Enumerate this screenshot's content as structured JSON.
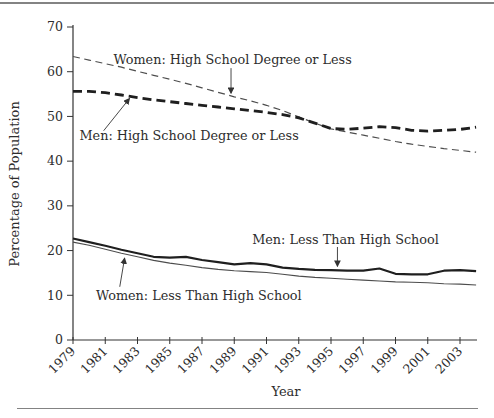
{
  "chart_data": {
    "type": "line",
    "title": "",
    "xlabel": "Year",
    "ylabel": "Percentage of Population",
    "ylim": [
      0,
      70
    ],
    "yticks": [
      0,
      10,
      20,
      30,
      40,
      50,
      60,
      70
    ],
    "xtick_years": [
      1979,
      1981,
      1983,
      1985,
      1987,
      1989,
      1991,
      1993,
      1995,
      1997,
      1999,
      2001,
      2003
    ],
    "x_start": 1979,
    "x_end": 2004,
    "grid": false,
    "legend_position": "inline-annotations",
    "years": [
      1979,
      1980,
      1981,
      1982,
      1983,
      1984,
      1985,
      1986,
      1987,
      1988,
      1989,
      1990,
      1991,
      1992,
      1993,
      1994,
      1995,
      1996,
      1997,
      1998,
      1999,
      2000,
      2001,
      2002,
      2003,
      2004
    ],
    "series": [
      {
        "name": "Women: High School Degree or Less",
        "line_style": "dashed-thin",
        "color": "#4d4d4d",
        "values": [
          63.4,
          62.6,
          61.8,
          61.0,
          60.1,
          59.2,
          58.3,
          57.4,
          56.4,
          55.4,
          54.4,
          53.5,
          52.5,
          51.3,
          49.9,
          48.5,
          47.2,
          46.5,
          45.8,
          45.1,
          44.4,
          43.8,
          43.3,
          42.8,
          42.4,
          42.0
        ]
      },
      {
        "name": "Men: High School Degree or Less",
        "line_style": "dashed-thick",
        "color": "#1f1f1f",
        "values": [
          55.6,
          55.6,
          55.3,
          54.8,
          54.2,
          53.7,
          53.3,
          52.9,
          52.5,
          52.1,
          51.7,
          51.3,
          50.9,
          50.4,
          49.7,
          48.5,
          47.3,
          47.1,
          47.4,
          47.7,
          47.5,
          46.9,
          46.7,
          46.9,
          47.1,
          47.6
        ]
      },
      {
        "name": "Men: Less Than High School",
        "line_style": "solid-thick",
        "color": "#1f1f1f",
        "values": [
          22.7,
          21.9,
          21.1,
          20.2,
          19.4,
          18.6,
          18.4,
          18.6,
          17.9,
          17.4,
          16.9,
          17.2,
          16.9,
          16.2,
          15.9,
          15.7,
          15.6,
          15.5,
          15.5,
          16.0,
          14.8,
          14.7,
          14.7,
          15.5,
          15.6,
          15.4
        ]
      },
      {
        "name": "Women: Less Than High School",
        "line_style": "solid-thin",
        "color": "#4d4d4d",
        "values": [
          21.9,
          21.2,
          20.3,
          19.4,
          18.6,
          17.8,
          17.2,
          16.7,
          16.2,
          15.8,
          15.5,
          15.3,
          15.1,
          14.7,
          14.3,
          14.0,
          13.8,
          13.6,
          13.4,
          13.2,
          13.0,
          12.9,
          12.8,
          12.6,
          12.5,
          12.3
        ]
      }
    ],
    "annotations": [
      {
        "text": "Women: High School Degree or Less",
        "x": 1988.9,
        "y": 62.6,
        "arrow_from": [
          1988.8,
          60.8
        ],
        "arrow_to": [
          1988.8,
          55.2
        ]
      },
      {
        "text": "Men: High School Degree or Less",
        "x": 1986.2,
        "y": 45.6,
        "arrow_from": [
          1980.9,
          46.8
        ],
        "arrow_to": [
          1982.5,
          54.0
        ]
      },
      {
        "text": "Men: Less Than High School",
        "x": 1995.9,
        "y": 22.5,
        "arrow_from": [
          1995.4,
          20.8
        ],
        "arrow_to": [
          1995.4,
          16.5
        ]
      },
      {
        "text": "Women: Less Than High School",
        "x": 1986.8,
        "y": 9.8,
        "arrow_from": [
          1981.9,
          11.9
        ],
        "arrow_to": [
          1982.2,
          18.3
        ]
      }
    ],
    "colors": {
      "axis": "#333333",
      "text": "#2d2d2d",
      "divider": "#838383",
      "background": "#ffffff"
    }
  }
}
